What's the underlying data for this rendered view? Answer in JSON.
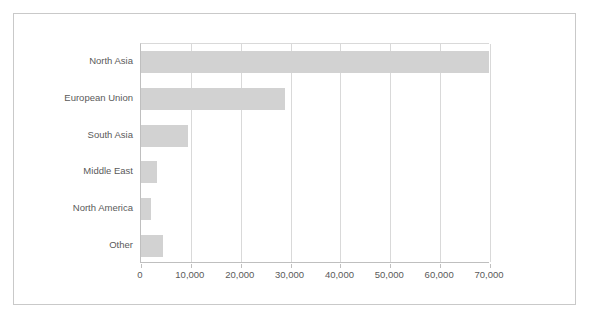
{
  "chart_data": {
    "type": "bar",
    "orientation": "horizontal",
    "title": "",
    "subtitle": "",
    "xlabel": "",
    "ylabel": "",
    "categories": [
      "North Asia",
      "European Union",
      "South Asia",
      "Middle East",
      "North America",
      "Other"
    ],
    "values": [
      69800,
      28800,
      9400,
      3300,
      2000,
      4500
    ],
    "series": [
      {
        "name": "",
        "values": [
          69800,
          28800,
          9400,
          3300,
          2000,
          4500
        ]
      }
    ],
    "xlim": [
      0,
      70000
    ],
    "ylim": null,
    "xticks": [
      0,
      10000,
      20000,
      30000,
      40000,
      50000,
      60000,
      70000
    ],
    "xtick_labels": [
      "0",
      "10,000",
      "20,000",
      "30,000",
      "40,000",
      "50,000",
      "60,000",
      "70,000"
    ],
    "grid": "vertical",
    "legend": "none",
    "legend_entries": [],
    "annotations": [],
    "bar_color": "#d2d2d2",
    "gridline_color": "#d9d9d9",
    "axis_color": "#bfbfbf",
    "text_color": "#5a5a5a",
    "frame_color": "#c9c9c9",
    "background_color": "#ffffff"
  }
}
